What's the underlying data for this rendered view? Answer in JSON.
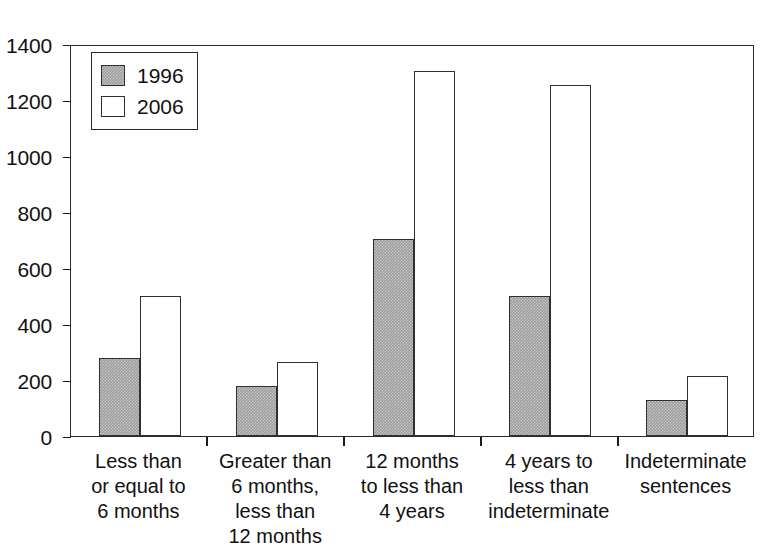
{
  "chart_data": {
    "type": "bar",
    "title": "",
    "subtitle": "",
    "xlabel": "",
    "ylabel": "",
    "ylim": [
      0,
      1400
    ],
    "ytick_step": 200,
    "yticks": [
      0,
      200,
      400,
      600,
      800,
      1000,
      1200,
      1400
    ],
    "grid": false,
    "legend_position": "top-left",
    "categories": [
      "Less than\nor equal to\n6 months",
      "Greater than\n6 months,\nless than\n12 months",
      "12 months\nto less than\n4 years",
      "4 years to\nless than\nindeterminate",
      "Indeterminate\nsentences"
    ],
    "category_lines": [
      [
        "Less than",
        "or equal to",
        "6 months"
      ],
      [
        "Greater than",
        "6 months,",
        "less than",
        "12 months"
      ],
      [
        "12 months",
        "to less than",
        "4 years"
      ],
      [
        "4 years to",
        "less than",
        "indeterminate"
      ],
      [
        "Indeterminate",
        "sentences"
      ]
    ],
    "series": [
      {
        "name": "1996",
        "color": "#9d9d9d",
        "values": [
          280,
          180,
          705,
          500,
          130
        ]
      },
      {
        "name": "2006",
        "color": "#ffffff",
        "values": [
          500,
          265,
          1305,
          1255,
          215
        ]
      }
    ]
  },
  "legend": {
    "items": [
      {
        "label": "1996",
        "swatch": "gray"
      },
      {
        "label": "2006",
        "swatch": "white"
      }
    ]
  },
  "axis": {
    "y_tick_labels": [
      "1400",
      "1200",
      "1000",
      "800",
      "600",
      "400",
      "200",
      "0"
    ]
  },
  "colors": {
    "series_1996": "#9d9d9d",
    "series_2006": "#ffffff",
    "axis": "#1a1a1a",
    "bar_outline": "#2f2f2f",
    "background": "#ffffff"
  }
}
